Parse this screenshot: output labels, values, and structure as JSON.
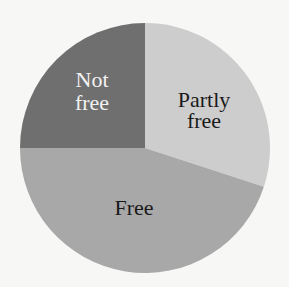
{
  "chart_data": {
    "type": "pie",
    "title": "",
    "start_angle_deg": 0,
    "direction": "clockwise",
    "categories": [
      "Partly free",
      "Free",
      "Not free"
    ],
    "values": [
      30,
      45,
      25
    ],
    "unit": "percent (estimated from slice angles)",
    "colors": [
      "#cdcdcd",
      "#a8a8a8",
      "#6f6f6f"
    ],
    "label_colors": [
      "#1a1a1a",
      "#1a1a1a",
      "#f2f2f2"
    ],
    "labels_inside": true,
    "legend": "none"
  },
  "labels": {
    "partly_free_line1": "Partly",
    "partly_free_line2": "free",
    "free": "Free",
    "not_free_line1": "Not",
    "not_free_line2": "free"
  }
}
